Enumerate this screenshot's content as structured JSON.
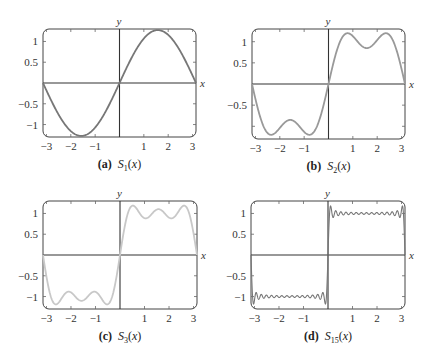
{
  "chart_data": [
    {
      "type": "line",
      "id": "a",
      "caption_label": "(a)",
      "caption_func": "S",
      "caption_sub": "1",
      "caption_arg": "(x)",
      "terms": 1,
      "color": "#777777",
      "xlabel": "x",
      "ylabel": "y",
      "xticks": [
        "-3",
        "-2",
        "-1",
        "1",
        "2",
        "3"
      ],
      "yticks": [
        "1",
        "0.5",
        "-0.5",
        "-1"
      ],
      "xlim": [
        -3.14159,
        3.14159
      ],
      "ylim": [
        -1.3,
        1.3
      ],
      "frame": {
        "left": 43,
        "right": 196,
        "top": 29,
        "bottom": 137
      }
    },
    {
      "type": "line",
      "id": "b",
      "caption_label": "(b)",
      "caption_func": "S",
      "caption_sub": "2",
      "caption_arg": "(x)",
      "terms": 2,
      "color": "#999999",
      "xlabel": "x",
      "ylabel": "y",
      "xticks": [
        "-3",
        "-2",
        "-1",
        "1",
        "2",
        "3"
      ],
      "yticks": [
        "1",
        "0.5",
        "-0.5"
      ],
      "xlim": [
        -3.14159,
        3.14159
      ],
      "ylim": [
        -1.3,
        1.3
      ],
      "frame": {
        "left": 252,
        "right": 405,
        "top": 29,
        "bottom": 139
      }
    },
    {
      "type": "line",
      "id": "c",
      "caption_label": "(c)",
      "caption_func": "S",
      "caption_sub": "3",
      "caption_arg": "(x)",
      "terms": 3,
      "color": "#c8c8c8",
      "xlabel": "x",
      "ylabel": "y",
      "xticks": [
        "-3",
        "-2",
        "-1",
        "1",
        "2",
        "3"
      ],
      "yticks": [
        "1",
        "0.5",
        "-0.5",
        "-1"
      ],
      "xlim": [
        -3.14159,
        3.14159
      ],
      "ylim": [
        -1.3,
        1.3
      ],
      "frame": {
        "left": 43,
        "right": 197,
        "top": 201,
        "bottom": 309
      }
    },
    {
      "type": "line",
      "id": "d",
      "caption_label": "(d)",
      "caption_func": "S",
      "caption_sub": "15",
      "caption_arg": "(x)",
      "terms": 15,
      "color": "#777777",
      "xlabel": "x",
      "ylabel": "y",
      "xticks": [
        "-3",
        "-2",
        "-1",
        "1",
        "2",
        "3"
      ],
      "yticks": [
        "1",
        "0.5",
        "-0.5",
        "-1"
      ],
      "xlim": [
        -3.14159,
        3.14159
      ],
      "ylim": [
        -1.3,
        1.3
      ],
      "frame": {
        "left": 251,
        "right": 405,
        "top": 201,
        "bottom": 309
      }
    }
  ],
  "formula": "S_n(x) = (4/pi) * sum_{k=1..n} sin((2k-1)x)/(2k-1)"
}
